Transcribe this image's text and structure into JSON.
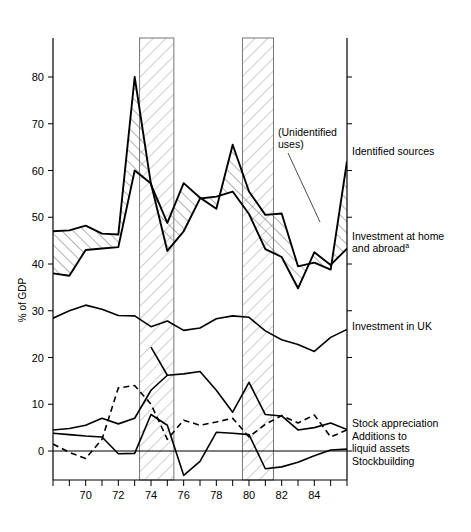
{
  "chart_data": {
    "type": "line",
    "title": "",
    "xlabel": "",
    "ylabel": "% of GDP",
    "xlim": [
      1968,
      1986
    ],
    "ylim": [
      -8,
      88
    ],
    "grid": false,
    "legend_position": "right-inline",
    "x": [
      1968,
      1969,
      1970,
      1971,
      1972,
      1973,
      1974,
      1975,
      1976,
      1977,
      1978,
      1979,
      1980,
      1981,
      1982,
      1983,
      1984,
      1985,
      1986
    ],
    "xticks": [
      1970,
      1972,
      1974,
      1976,
      1978,
      1980,
      1982,
      1984
    ],
    "xtick_labels": [
      "70",
      "72",
      "74",
      "76",
      "78",
      "80",
      "82",
      "84"
    ],
    "yticks": [
      0,
      10,
      20,
      30,
      40,
      50,
      60,
      70,
      80
    ],
    "ytick_labels": [
      "0",
      "10",
      "20",
      "30",
      "40",
      "50",
      "60",
      "70",
      "80"
    ],
    "series": [
      {
        "name": "Identified sources",
        "style": "solid",
        "values": [
          47.0,
          47.2,
          48.2,
          46.5,
          46.3,
          80.0,
          57.0,
          48.8,
          57.3,
          54.2,
          51.8,
          65.5,
          55.5,
          50.5,
          50.8,
          39.5,
          40.3,
          38.8,
          62.0
        ]
      },
      {
        "name": "Investment at home and abroad",
        "style": "solid",
        "values": [
          38.0,
          37.5,
          43.0,
          43.3,
          43.6,
          60.0,
          57.2,
          42.8,
          47.0,
          54.0,
          54.4,
          55.5,
          50.7,
          43.2,
          41.5,
          34.8,
          42.5,
          39.8,
          43.3
        ]
      },
      {
        "name": "Investment in UK",
        "style": "solid",
        "values": [
          28.4,
          30.0,
          31.2,
          30.3,
          29.0,
          28.9,
          26.6,
          27.8,
          25.8,
          26.3,
          28.3,
          28.9,
          28.6,
          25.7,
          23.8,
          22.8,
          21.3,
          24.3,
          26.0
        ]
      },
      {
        "name": "Stock appreciation",
        "style": "solid",
        "values": [
          4.5,
          4.8,
          5.5,
          7.0,
          5.8,
          7.0,
          13.0,
          16.2,
          16.5,
          17.0,
          13.0,
          8.3,
          14.7,
          7.8,
          7.5,
          4.5,
          5.0,
          6.0,
          4.6
        ]
      },
      {
        "name": "Additions to liquid assets",
        "style": "dashed",
        "values": [
          1.5,
          -0.3,
          -1.6,
          2.5,
          13.5,
          14.0,
          10.0,
          2.5,
          6.6,
          5.5,
          6.2,
          7.0,
          3.0,
          5.7,
          7.6,
          6.0,
          7.7,
          3.0,
          4.5
        ]
      },
      {
        "name": "Stockbuilding",
        "style": "solid",
        "values": [
          3.8,
          3.5,
          3.2,
          3.0,
          -0.6,
          -0.5,
          7.8,
          5.5,
          -5.2,
          -2.2,
          4.0,
          3.8,
          3.5,
          -3.8,
          -3.4,
          -2.4,
          -1.0,
          0.2,
          0.4
        ]
      },
      {
        "name": "crossing-line-74",
        "style": "solid",
        "values": [
          null,
          null,
          null,
          null,
          null,
          null,
          22.2,
          16.2,
          null,
          null,
          null,
          null,
          null,
          null,
          null,
          null,
          null,
          null,
          null
        ]
      }
    ],
    "shaded_bands": [
      {
        "label": "recession-band-1",
        "x_start": 1973.3,
        "x_end": 1975.4
      },
      {
        "label": "recession-band-2",
        "x_start": 1979.6,
        "x_end": 1981.5
      }
    ],
    "annotations": [
      {
        "name": "unidentified-uses",
        "text_line1": "(Unidentified",
        "text_line2": "uses)",
        "points_to_x": 1982.0,
        "points_to_y": 47.0
      }
    ]
  },
  "axis": {
    "ylabel": "% of GDP"
  },
  "labels": {
    "identified_sources": "Identified sources",
    "investment_home_abroad_line1": "Investment at home",
    "investment_home_abroad_line2": "and abroad",
    "investment_home_abroad_footnote": "a",
    "investment_uk": "Investment in UK",
    "stock_appreciation": "Stock appreciation",
    "additions_liquid_line1": "Additions to",
    "additions_liquid_line2": "liquid assets",
    "stockbuilding": "Stockbuilding",
    "unidentified_line1": "(Unidentified",
    "unidentified_line2": "uses)"
  },
  "colors": {
    "line": "#000000",
    "background": "#ffffff",
    "hatch": "#444444",
    "band_edge": "#777777"
  }
}
